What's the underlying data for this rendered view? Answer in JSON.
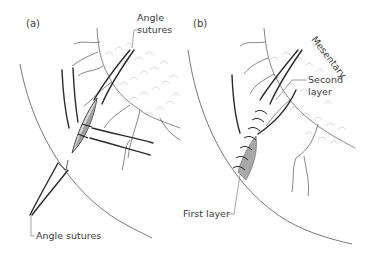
{
  "figure": {
    "panels": [
      {
        "id": "a",
        "label": "(a)",
        "annotations": {
          "top": "Angle sutures",
          "top_line1": "Angle",
          "top_line2": "sutures",
          "bottom": "Angle sutures"
        }
      },
      {
        "id": "b",
        "label": "(b)",
        "annotations": {
          "mesentery": "Mesentary",
          "second_layer_line1": "Second",
          "second_layer_line2": "layer",
          "first_layer": "First layer"
        }
      }
    ],
    "colors": {
      "background": "#ffffff",
      "ink": "#2a2a2a",
      "vessel": "#555555",
      "fat": "#c8c8c8",
      "text": "#3a3a3a"
    }
  }
}
